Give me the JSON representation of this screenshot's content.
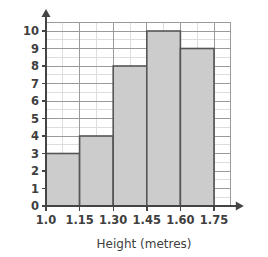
{
  "chart_data": {
    "type": "bar",
    "title": "",
    "subtitle": "",
    "xlabel": "Height (metres)",
    "ylabel": "Frequency",
    "categories": [
      "1.0-1.15",
      "1.15-1.30",
      "1.30-1.45",
      "1.45-1.60",
      "1.60-1.75"
    ],
    "values": [
      3,
      4,
      8,
      10,
      9
    ],
    "bin_edges": [
      1.0,
      1.15,
      1.3,
      1.45,
      1.6,
      1.75
    ],
    "x_tick_labels": [
      "1.0",
      "1.15",
      "1.30",
      "1.45",
      "1.60",
      "1.75"
    ],
    "y_tick_labels": [
      "0",
      "1",
      "2",
      "3",
      "4",
      "5",
      "6",
      "7",
      "8",
      "9",
      "10"
    ],
    "y_ticks": [
      0,
      1,
      2,
      3,
      4,
      5,
      6,
      7,
      8,
      9,
      10
    ],
    "ylim": [
      0,
      10
    ],
    "xlim": [
      1.0,
      1.75
    ],
    "grid": true,
    "minor_grid": true,
    "legend": null,
    "legend_position": "none",
    "annotations": [],
    "colors": {
      "bar_fill": "#cccccc",
      "bar_stroke": "#555555",
      "major_grid": "#9a9a9a",
      "minor_grid": "#dddddd",
      "axis_line": "#444444",
      "text": "#404040",
      "background": "#ffffff"
    }
  },
  "axes": {
    "y_axis_label": "Frequency",
    "x_axis_label": "Height (metres)",
    "y_arrow": "arrow-up-icon",
    "x_arrow": "arrow-right-icon"
  }
}
